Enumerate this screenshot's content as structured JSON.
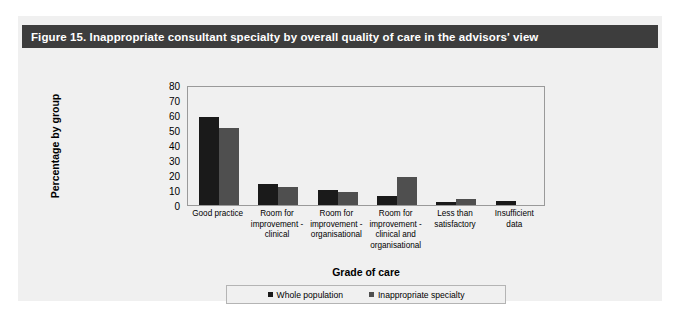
{
  "figure": {
    "title": "Figure 15. Inappropriate consultant specialty by overall quality of care in the advisors' view",
    "header_bg": "#3d3d3d",
    "panel_bg": "#f0f0f0"
  },
  "chart_data": {
    "type": "bar",
    "title": "Figure 15. Inappropriate consultant specialty by overall quality of care in the advisors' view",
    "xlabel": "Grade of care",
    "ylabel": "Percentage by group",
    "ylim": [
      0,
      80
    ],
    "yticks": [
      0,
      10,
      20,
      30,
      40,
      50,
      60,
      70,
      80
    ],
    "ytick_labels": [
      "0",
      "10",
      "20",
      "30",
      "40",
      "50",
      "60",
      "70",
      "80"
    ],
    "grid": false,
    "legend_position": "bottom",
    "categories": [
      "Good practice",
      "Room for improvement - clinical",
      "Room for improvement - organisational",
      "Room for improvement - clinical and organisational",
      "Less than satisfactory",
      "Insufficient data"
    ],
    "category_lines": [
      [
        "Good practice"
      ],
      [
        "Room for",
        "improvement -",
        "clinical"
      ],
      [
        "Room for",
        "improvement -",
        "organisational"
      ],
      [
        "Room for",
        "improvement -",
        "clinical and",
        "organisational"
      ],
      [
        "Less than",
        "satisfactory"
      ],
      [
        "Insufficient",
        "data"
      ]
    ],
    "series": [
      {
        "name": "Whole population",
        "color": "#1a1a1a",
        "values": [
          60,
          14,
          10,
          6,
          2,
          3
        ]
      },
      {
        "name": "Inappropriate specialty",
        "color": "#4f4f4f",
        "values": [
          52,
          12,
          9,
          19,
          4,
          0
        ]
      }
    ]
  }
}
